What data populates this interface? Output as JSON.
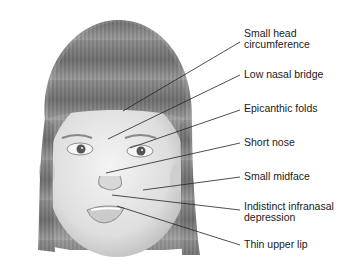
{
  "diagram": {
    "labels": [
      {
        "id": "small-head",
        "text": "Small head",
        "text2": "circumference",
        "x": 244,
        "y": 28,
        "line": [
          123,
          111,
          240,
          42
        ]
      },
      {
        "id": "low-nasal-bridge",
        "text": "Low nasal bridge",
        "x": 244,
        "y": 69,
        "line": [
          108,
          139,
          240,
          75
        ]
      },
      {
        "id": "epicanthic-folds",
        "text": "Epicanthic folds",
        "x": 244,
        "y": 103,
        "line": [
          130,
          148,
          240,
          110
        ]
      },
      {
        "id": "short-nose",
        "text": "Short nose",
        "x": 244,
        "y": 137,
        "line": [
          106,
          173,
          240,
          143
        ]
      },
      {
        "id": "small-midface",
        "text": "Small midface",
        "x": 244,
        "y": 171,
        "line": [
          143,
          190,
          240,
          177
        ]
      },
      {
        "id": "indistinct-infranasal",
        "text": "Indistinct infranasal",
        "text2": "depression",
        "x": 244,
        "y": 201,
        "line": [
          112,
          195,
          240,
          210
        ]
      },
      {
        "id": "thin-upper-lip",
        "text": "Thin upper lip",
        "x": 244,
        "y": 239,
        "line": [
          117,
          206,
          240,
          245
        ]
      }
    ],
    "colors": {
      "line": "#222222",
      "text": "#1a1a1a",
      "hair": "#6e6e6e",
      "skin": "#e9e9e9"
    }
  }
}
